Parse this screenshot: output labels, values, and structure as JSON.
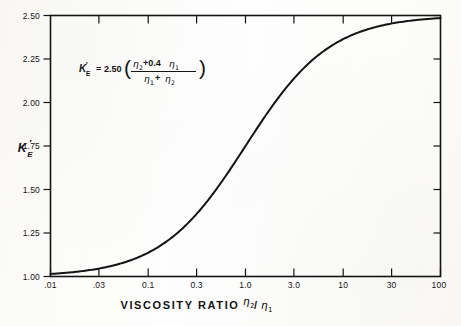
{
  "figure": {
    "background_color": "#fdfdfb",
    "ink_color": "#141414",
    "equation": {
      "lhs_symbol": "K",
      "lhs_prime": "′",
      "lhs_subscript": "E",
      "equals": "=",
      "coefficient": "2.50",
      "paren_open": "(",
      "paren_close": ")",
      "numerator_eta2": "η",
      "numerator_eta2_sub": "2",
      "numerator_plus": "+0.4",
      "numerator_eta1": "η",
      "numerator_eta1_sub": "1",
      "denominator_eta1": "η",
      "denominator_eta1_sub": "1",
      "denominator_plus": "+",
      "denominator_eta2": "η",
      "denominator_eta2_sub": "2",
      "plain_text": "K'E = 2.50 ( (η2 + 0.4 η1) / (η1 + η2) )"
    },
    "y_axis_label": {
      "symbol": "K",
      "prime": "′",
      "subscript": "E"
    },
    "x_axis_title": {
      "text": "VISCOSITY  RATIO",
      "symbol_numerator": "η",
      "symbol_numerator_sub": "2",
      "slash": "/",
      "symbol_denominator": "η",
      "symbol_denominator_sub": "1"
    }
  },
  "chart_data": {
    "type": "line",
    "title": "",
    "xlabel": "VISCOSITY RATIO η2/η1",
    "ylabel": "K'E",
    "x_scale": "log",
    "y_scale": "linear",
    "xlim": [
      0.01,
      100
    ],
    "ylim": [
      1.0,
      2.5
    ],
    "grid": false,
    "legend": "none",
    "x_tick_labels": [
      ".01",
      ".03",
      "0.1",
      "0.3",
      "1.0",
      "3.0",
      "10",
      "30",
      "100"
    ],
    "x_tick_values": [
      0.01,
      0.03,
      0.1,
      0.3,
      1.0,
      3.0,
      10,
      30,
      100
    ],
    "y_tick_labels": [
      "1.00",
      "1.25",
      "1.50",
      "1.75",
      "2.00",
      "2.25",
      "2.50"
    ],
    "y_tick_values": [
      1.0,
      1.25,
      1.5,
      1.75,
      2.0,
      2.25,
      2.5
    ],
    "annotations": [
      {
        "text": "K'E = 2.50 ((η2+0.4η1)/(η1+η2))",
        "x": 0.045,
        "y": 2.28
      }
    ],
    "series": [
      {
        "name": "K'E",
        "formula": "2.50*(r + 0.4)/(1 + r) where r = eta2/eta1",
        "x": [
          0.01,
          0.015,
          0.02,
          0.03,
          0.05,
          0.07,
          0.1,
          0.15,
          0.2,
          0.3,
          0.5,
          0.7,
          1.0,
          1.5,
          2.0,
          3.0,
          5.0,
          7.0,
          10.0,
          15.0,
          20.0,
          30.0,
          50.0,
          70.0,
          100.0
        ],
        "y": [
          1.015,
          1.022,
          1.029,
          1.044,
          1.071,
          1.098,
          1.136,
          1.196,
          1.25,
          1.346,
          1.5,
          1.618,
          1.75,
          1.9,
          2.0,
          2.125,
          2.25,
          2.319,
          2.386,
          2.43,
          2.452,
          2.476,
          2.485,
          2.493,
          2.494
        ]
      }
    ]
  }
}
